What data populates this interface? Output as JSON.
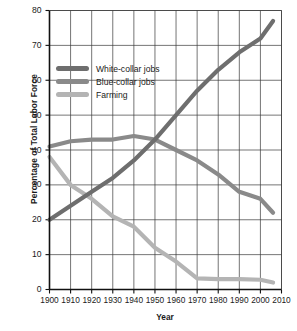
{
  "chart_data": {
    "type": "line",
    "title": "",
    "xlabel": "Year",
    "ylabel": "Percentage of Total Labor Force",
    "xlim": [
      1900,
      2010
    ],
    "ylim": [
      0,
      80
    ],
    "grid": true,
    "legend_position": "upper-left-inside",
    "xticks": [
      "1900",
      "1910",
      "1920",
      "1930",
      "1940",
      "1950",
      "1960",
      "1970",
      "1980",
      "1990",
      "2000",
      "2010"
    ],
    "yticks": [
      "0",
      "10",
      "20",
      "30",
      "40",
      "50",
      "60",
      "70",
      "80"
    ],
    "x": [
      1900,
      1910,
      1920,
      1930,
      1940,
      1950,
      1960,
      1970,
      1980,
      1990,
      2000,
      2006
    ],
    "series": [
      {
        "name": "White-collar jobs",
        "color": "#6e6e6e",
        "values": [
          20,
          24,
          28,
          32,
          37,
          43,
          50,
          57,
          63,
          68,
          72,
          77
        ]
      },
      {
        "name": "Blue-collar jobs",
        "color": "#8a8a8a",
        "values": [
          41,
          42.5,
          43,
          43,
          44,
          43,
          40,
          37,
          33,
          28,
          26,
          22
        ]
      },
      {
        "name": "Farming",
        "color": "#b4b4b4",
        "values": [
          38,
          30,
          26,
          21,
          18,
          12,
          8,
          3.2,
          3,
          3,
          2.8,
          2
        ]
      }
    ]
  },
  "legend": {
    "items": [
      {
        "label": "White-collar jobs",
        "color": "#6e6e6e"
      },
      {
        "label": "Blue-collar jobs",
        "color": "#8a8a8a"
      },
      {
        "label": "Farming",
        "color": "#b4b4b4"
      }
    ]
  },
  "axes": {
    "x_title": "Year",
    "y_title": "Percentage of Total Labor Force"
  }
}
